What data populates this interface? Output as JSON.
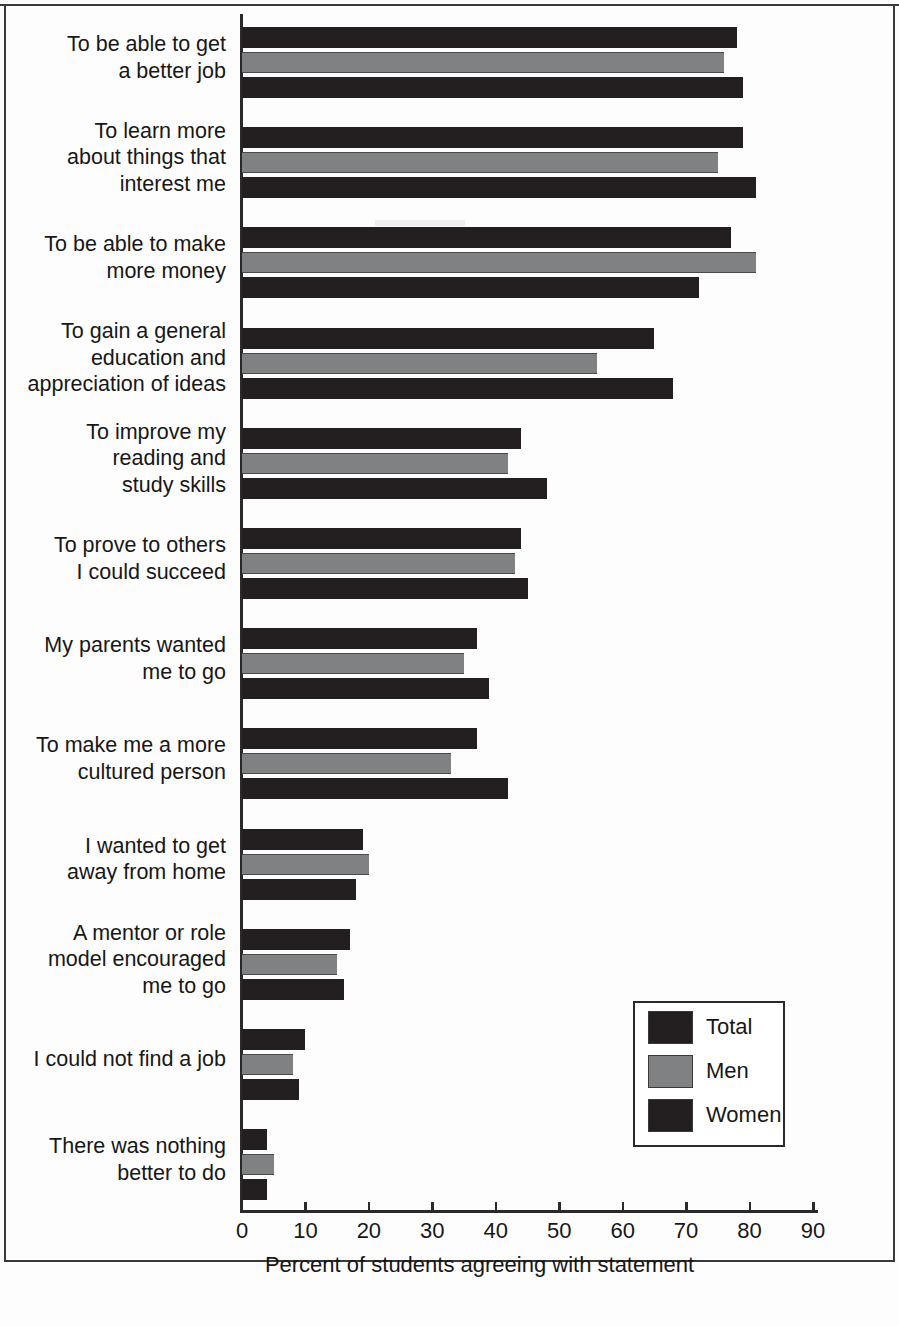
{
  "chart_data": {
    "type": "bar",
    "orientation": "horizontal",
    "title": "",
    "xlabel": "Percent of students agreeing with statement",
    "ylabel": "",
    "xlim": [
      0,
      90
    ],
    "xticks": [
      0,
      10,
      20,
      30,
      40,
      50,
      60,
      70,
      80,
      90
    ],
    "tick_labels": [
      "0",
      "10",
      "20",
      "30",
      "40",
      "50",
      "60",
      "70",
      "80",
      "90"
    ],
    "grid": false,
    "legend_position": "center-right",
    "categories": [
      "To be able to get\na better job",
      "To learn more\nabout things that\ninterest me",
      "To be able to make\nmore money",
      "To gain a general\neducation and\nappreciation of ideas",
      "To improve my\nreading and\nstudy skills",
      "To prove to others\nI could succeed",
      "My parents wanted\nme to go",
      "To make me a more\ncultured person",
      "I wanted to get\naway from home",
      "A mentor or role\nmodel encouraged\nme to go",
      "I could not find a job",
      "There was nothing\nbetter to do"
    ],
    "category_lines": [
      [
        "To be able to get",
        "a better job"
      ],
      [
        "To learn more",
        "about things that",
        "interest me"
      ],
      [
        "To be able to make",
        "more money"
      ],
      [
        "To gain a general",
        "education and",
        "appreciation of ideas"
      ],
      [
        "To improve my",
        "reading and",
        "study skills"
      ],
      [
        "To prove to others",
        "I could succeed"
      ],
      [
        "My parents wanted",
        "me to go"
      ],
      [
        "To make me a more",
        "cultured person"
      ],
      [
        "I wanted to get",
        "away from home"
      ],
      [
        "A mentor or role",
        "model encouraged",
        "me to go"
      ],
      [
        "I could not find a job"
      ],
      [
        "There was nothing",
        "better to do"
      ]
    ],
    "series": [
      {
        "name": "Total",
        "color": "#231f20",
        "values": [
          78,
          79,
          77,
          65,
          44,
          44,
          37,
          37,
          19,
          17,
          10,
          4
        ]
      },
      {
        "name": "Men",
        "color": "#7f8183",
        "values": [
          76,
          75,
          81,
          56,
          42,
          43,
          35,
          33,
          20,
          15,
          8,
          5
        ]
      },
      {
        "name": "Women",
        "color": "#231f20",
        "values": [
          79,
          81,
          72,
          68,
          48,
          45,
          39,
          42,
          18,
          16,
          9,
          4
        ]
      }
    ]
  },
  "legend": {
    "entries": [
      {
        "label": "Total",
        "color": "#231f20"
      },
      {
        "label": "Men",
        "color": "#7f8183"
      },
      {
        "label": "Women",
        "color": "#231f20"
      }
    ]
  },
  "axis": {
    "x_title": "Percent of students agreeing with statement"
  }
}
